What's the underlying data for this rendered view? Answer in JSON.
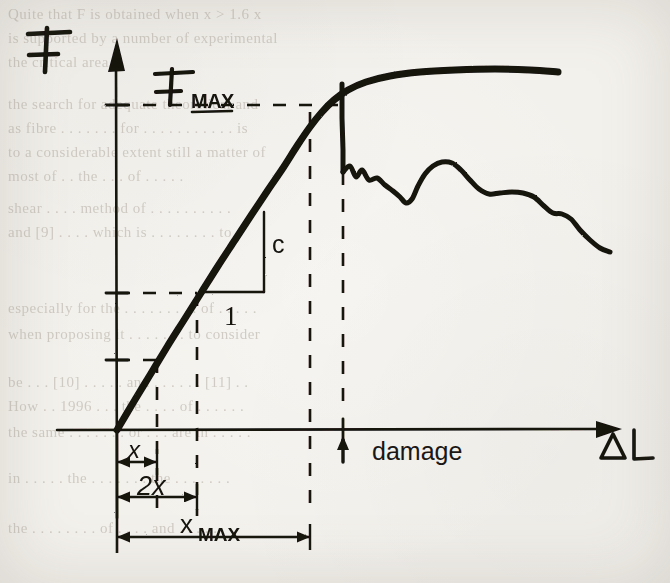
{
  "figure": {
    "kind": "scanned-handwritten-plot",
    "paper_color": "#f3f1ec",
    "ink_color": "#141210",
    "ghost_color": "#b9b4aa"
  },
  "axes": {
    "y_label": "F",
    "x_label": "ΔL",
    "origin": {
      "x": 117,
      "y": 430
    },
    "y_axis_top": {
      "x": 117,
      "y": 38
    },
    "x_axis_right": {
      "x": 622,
      "y": 430
    }
  },
  "annotations": {
    "fmax_label": "F",
    "fmax_sub": "MAX",
    "slope_rise_label": "c",
    "slope_run_label": "1",
    "damage_label": "damage",
    "dim_x_label": "x",
    "dim_2x_label": "2x",
    "dim_xmax_label": "x",
    "dim_xmax_sub": "MAX"
  },
  "chart_data": {
    "type": "line",
    "title": "",
    "xlabel": "ΔL",
    "ylabel": "F",
    "grid": false,
    "legend": "none",
    "axis_ranges": {
      "x": [
        0,
        1
      ],
      "y": [
        0,
        1
      ]
    },
    "reference_levels": [
      {
        "name": "F_MAX",
        "y_px": 105,
        "style": "dashed",
        "from_x_px": 117,
        "to_x_px": 340
      },
      {
        "name": "F at 2x",
        "y_px": 293,
        "style": "dashed",
        "from_x_px": 117,
        "to_x_px": 197
      },
      {
        "name": "F at x",
        "y_px": 360,
        "style": "dashed",
        "from_x_px": 117,
        "to_x_px": 157
      }
    ],
    "reference_verticals": [
      {
        "name": "x",
        "x_px": 157,
        "style": "dashed",
        "from_y_px": 360,
        "to_y_px": 516
      },
      {
        "name": "2x",
        "x_px": 197,
        "style": "dashed",
        "from_y_px": 293,
        "to_y_px": 516
      },
      {
        "name": "x_MAX",
        "x_px": 310,
        "style": "dashed",
        "from_y_px": 112,
        "to_y_px": 516
      },
      {
        "name": "damage",
        "x_px": 343,
        "style": "dashed",
        "from_y_px": 145,
        "to_y_px": 412
      }
    ],
    "series": [
      {
        "name": "loading",
        "kind": "linear-elastic-then-hardening",
        "stroke_px": 7,
        "points_px": [
          [
            117,
            430
          ],
          [
            133,
            403
          ],
          [
            150,
            375
          ],
          [
            167,
            347
          ],
          [
            184,
            320
          ],
          [
            201,
            293
          ],
          [
            218,
            266
          ],
          [
            235,
            240
          ],
          [
            252,
            214
          ],
          [
            268,
            190
          ],
          [
            283,
            168
          ],
          [
            297,
            146
          ],
          [
            310,
            127
          ],
          [
            322,
            112
          ],
          [
            334,
            100
          ],
          [
            348,
            90
          ],
          [
            366,
            82
          ],
          [
            390,
            76
          ],
          [
            420,
            72
          ],
          [
            455,
            70
          ],
          [
            495,
            69
          ],
          [
            530,
            70
          ],
          [
            558,
            72
          ]
        ]
      },
      {
        "name": "damage-drop",
        "kind": "vertical-failure",
        "stroke_px": 5,
        "points_px": [
          [
            342,
            84
          ],
          [
            342,
            118
          ],
          [
            343,
            150
          ],
          [
            343,
            172
          ]
        ]
      },
      {
        "name": "post-failure",
        "kind": "jagged-decline",
        "stroke_px": 5,
        "points_px": [
          [
            343,
            172
          ],
          [
            350,
            166
          ],
          [
            356,
            177
          ],
          [
            362,
            170
          ],
          [
            369,
            180
          ],
          [
            377,
            178
          ],
          [
            385,
            185
          ],
          [
            393,
            191
          ],
          [
            400,
            197
          ],
          [
            406,
            203
          ],
          [
            412,
            199
          ],
          [
            418,
            186
          ],
          [
            425,
            174
          ],
          [
            433,
            166
          ],
          [
            442,
            162
          ],
          [
            452,
            163
          ],
          [
            461,
            170
          ],
          [
            470,
            180
          ],
          [
            479,
            189
          ],
          [
            489,
            194
          ],
          [
            500,
            193
          ],
          [
            512,
            192
          ],
          [
            523,
            193
          ],
          [
            534,
            197
          ],
          [
            544,
            206
          ],
          [
            553,
            213
          ],
          [
            562,
            214
          ],
          [
            571,
            219
          ],
          [
            580,
            230
          ],
          [
            590,
            240
          ],
          [
            600,
            248
          ],
          [
            610,
            252
          ]
        ]
      }
    ],
    "slope_triangle": {
      "corner_px": [
        204,
        292
      ],
      "run_to_px": [
        264,
        292
      ],
      "rise_to_px": [
        264,
        212
      ],
      "run_label": "1",
      "rise_label": "c"
    },
    "dimensions": [
      {
        "label": "x",
        "from_x_px": 117,
        "to_x_px": 157,
        "y_px": 462
      },
      {
        "label": "2x",
        "from_x_px": 117,
        "to_x_px": 197,
        "y_px": 497
      },
      {
        "label": "xMAX",
        "from_x_px": 117,
        "to_x_px": 310,
        "y_px": 537
      }
    ],
    "markers": [
      {
        "name": "damage-pointer",
        "x_px": 343,
        "y_px": 430,
        "direction": "up",
        "label": "damage"
      }
    ]
  },
  "ghost_text": {
    "note": "faint show-through printed text from the underlying page",
    "lines": [
      {
        "text": "Quite that F   is obtained when  x > 1.6 x",
        "x": 8,
        "y": 6,
        "size": 15
      },
      {
        "text": "is supported by a number of experimental",
        "x": 8,
        "y": 30,
        "size": 15
      },
      {
        "text": "the critical area.",
        "x": 8,
        "y": 54,
        "size": 15
      },
      {
        "text": "the search for adequate theoretical and",
        "x": 8,
        "y": 96,
        "size": 15
      },
      {
        "text": "as fibre . . . . . . .  for  . . . . . . . . . . . is",
        "x": 8,
        "y": 120,
        "size": 15
      },
      {
        "text": "to a considerable extent still a matter of",
        "x": 8,
        "y": 144,
        "size": 15
      },
      {
        "text": "most of  . .  the  . . .  of  . . . . .",
        "x": 8,
        "y": 168,
        "size": 15
      },
      {
        "text": "shear  . . . .  method  of  . . . . . . . . . .",
        "x": 8,
        "y": 200,
        "size": 15
      },
      {
        "text": "and  [9] . . . .  which  is  . . . . . . . .  to",
        "x": 8,
        "y": 224,
        "size": 15
      },
      {
        "text": "especially for the  . . . . . . . . .  of  . . . . .",
        "x": 8,
        "y": 300,
        "size": 15
      },
      {
        "text": "when  proposing   it  . . . . . . .  to  consider",
        "x": 8,
        "y": 326,
        "size": 15
      },
      {
        "text": "be  . . .  [10] . . . . .  and  . . . . . .  [11] . .",
        "x": 8,
        "y": 374,
        "size": 15
      },
      {
        "text": "How  . .  1996  . . .  the  . . . .  of  . . . . . .",
        "x": 8,
        "y": 398,
        "size": 15
      },
      {
        "text": "the same  . . . . . . .  or  . . .  are  in  . . . . .",
        "x": 8,
        "y": 424,
        "size": 15
      },
      {
        "text": "in  . . . . .  the  . . . . . . .  the  . . . . . . .",
        "x": 8,
        "y": 470,
        "size": 15
      },
      {
        "text": "the  . . . . . . . .  of  . . . .  and  . . . . .",
        "x": 8,
        "y": 520,
        "size": 15
      }
    ]
  }
}
